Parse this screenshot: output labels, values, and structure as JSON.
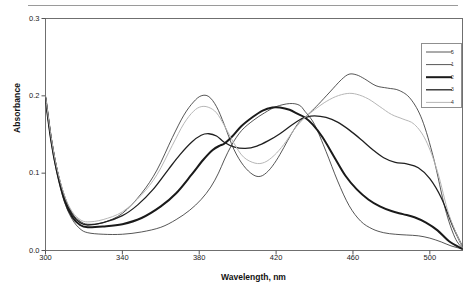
{
  "chart_data": {
    "type": "line",
    "title": "",
    "xlabel": "Wavelength, nm",
    "ylabel": "Absorbance",
    "xlim": [
      300,
      517
    ],
    "ylim": [
      0.0,
      0.3
    ],
    "xticks": [
      300,
      340,
      380,
      420,
      460,
      500
    ],
    "xtick_labels": [
      "300",
      "340",
      "380",
      "420",
      "460",
      "500"
    ],
    "yticks": [
      0.0,
      0.1,
      0.2,
      0.3
    ],
    "ytick_labels": [
      "0.0",
      "0.1",
      "0.2",
      "0.3"
    ],
    "grid": false,
    "legend_position": "upper-right",
    "isosbestic_points": [
      {
        "x": 393,
        "y": 0.137
      },
      {
        "x": 435,
        "y": 0.172
      }
    ],
    "series": [
      {
        "name": "5",
        "label": "5",
        "color": "#2b2b2b",
        "width": 0.8,
        "x": [
          300,
          303,
          306,
          310,
          314,
          318,
          322,
          330,
          340,
          350,
          360,
          368,
          375,
          381,
          386,
          390,
          393,
          397,
          402,
          408,
          414,
          420,
          427,
          432,
          435,
          440,
          446,
          452,
          458,
          464,
          470,
          476,
          482,
          488,
          494,
          500,
          506,
          511,
          517
        ],
        "y": [
          0.196,
          0.14,
          0.1,
          0.062,
          0.04,
          0.028,
          0.023,
          0.021,
          0.021,
          0.024,
          0.03,
          0.04,
          0.052,
          0.066,
          0.082,
          0.1,
          0.117,
          0.137,
          0.155,
          0.168,
          0.178,
          0.186,
          0.19,
          0.188,
          0.18,
          0.163,
          0.128,
          0.09,
          0.058,
          0.038,
          0.028,
          0.023,
          0.021,
          0.02,
          0.019,
          0.016,
          0.011,
          0.006,
          0.002
        ]
      },
      {
        "name": "1",
        "label": "1",
        "color": "#2b2b2b",
        "width": 0.8,
        "x": [
          300,
          303,
          306,
          310,
          314,
          318,
          322,
          330,
          340,
          350,
          358,
          366,
          372,
          377,
          381,
          385,
          389,
          393,
          398,
          403,
          408,
          412,
          416,
          420,
          424,
          428,
          432,
          435,
          438,
          442,
          448,
          454,
          458,
          462,
          466,
          472,
          478,
          484,
          490,
          496,
          502,
          508,
          513,
          517
        ],
        "y": [
          0.2,
          0.145,
          0.105,
          0.07,
          0.048,
          0.038,
          0.034,
          0.036,
          0.048,
          0.074,
          0.104,
          0.146,
          0.175,
          0.192,
          0.2,
          0.199,
          0.186,
          0.163,
          0.131,
          0.11,
          0.098,
          0.096,
          0.103,
          0.116,
          0.133,
          0.151,
          0.166,
          0.172,
          0.179,
          0.189,
          0.205,
          0.221,
          0.228,
          0.227,
          0.222,
          0.213,
          0.21,
          0.207,
          0.196,
          0.169,
          0.119,
          0.054,
          0.017,
          0.003
        ]
      },
      {
        "name": "2",
        "label": "2",
        "color": "#1a1a1a",
        "width": 2.0,
        "x": [
          300,
          303,
          306,
          310,
          314,
          318,
          322,
          330,
          340,
          350,
          360,
          368,
          376,
          382,
          387,
          391,
          393,
          397,
          402,
          408,
          413,
          418,
          422,
          427,
          431,
          435,
          439,
          444,
          450,
          456,
          462,
          468,
          474,
          480,
          486,
          492,
          498,
          504,
          510,
          517
        ],
        "y": [
          0.197,
          0.142,
          0.102,
          0.064,
          0.043,
          0.033,
          0.03,
          0.031,
          0.034,
          0.042,
          0.057,
          0.074,
          0.098,
          0.117,
          0.13,
          0.136,
          0.138,
          0.147,
          0.161,
          0.173,
          0.181,
          0.185,
          0.185,
          0.182,
          0.177,
          0.172,
          0.163,
          0.147,
          0.122,
          0.097,
          0.079,
          0.066,
          0.057,
          0.051,
          0.047,
          0.043,
          0.036,
          0.026,
          0.012,
          0.002
        ]
      },
      {
        "name": "3",
        "label": "3",
        "color": "#202020",
        "width": 1.3,
        "x": [
          300,
          303,
          306,
          310,
          314,
          318,
          322,
          330,
          340,
          348,
          356,
          364,
          370,
          376,
          381,
          385,
          389,
          393,
          398,
          404,
          410,
          416,
          422,
          428,
          433,
          435,
          440,
          446,
          452,
          458,
          464,
          470,
          476,
          482,
          488,
          494,
          500,
          506,
          512,
          517
        ],
        "y": [
          0.198,
          0.144,
          0.104,
          0.067,
          0.046,
          0.036,
          0.033,
          0.036,
          0.045,
          0.059,
          0.079,
          0.105,
          0.124,
          0.14,
          0.149,
          0.151,
          0.148,
          0.14,
          0.134,
          0.132,
          0.135,
          0.142,
          0.151,
          0.162,
          0.17,
          0.172,
          0.174,
          0.172,
          0.166,
          0.156,
          0.144,
          0.131,
          0.12,
          0.114,
          0.112,
          0.107,
          0.093,
          0.068,
          0.031,
          0.005
        ]
      },
      {
        "name": "4",
        "label": "4",
        "color": "#b6b6b6",
        "width": 1.0,
        "x": [
          300,
          303,
          306,
          310,
          314,
          318,
          322,
          330,
          340,
          350,
          358,
          366,
          372,
          377,
          381,
          385,
          389,
          393,
          398,
          403,
          409,
          414,
          419,
          424,
          429,
          433,
          435,
          440,
          445,
          451,
          457,
          462,
          468,
          474,
          480,
          486,
          492,
          498,
          504,
          510,
          517
        ],
        "y": [
          0.2,
          0.146,
          0.106,
          0.07,
          0.05,
          0.04,
          0.037,
          0.04,
          0.05,
          0.072,
          0.098,
          0.136,
          0.164,
          0.18,
          0.186,
          0.185,
          0.178,
          0.162,
          0.139,
          0.121,
          0.113,
          0.114,
          0.123,
          0.137,
          0.155,
          0.167,
          0.172,
          0.182,
          0.191,
          0.199,
          0.203,
          0.202,
          0.196,
          0.186,
          0.176,
          0.17,
          0.163,
          0.142,
          0.102,
          0.046,
          0.004
        ]
      }
    ]
  },
  "legend": {
    "entries": [
      {
        "label": "5"
      },
      {
        "label": "1"
      },
      {
        "label": "2"
      },
      {
        "label": "3"
      },
      {
        "label": "4"
      }
    ]
  }
}
